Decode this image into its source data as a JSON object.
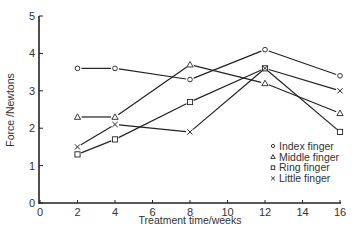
{
  "chart_data": {
    "type": "line",
    "title": "",
    "xlabel": "Treatment time/weeks",
    "ylabel": "Force /Newtons",
    "xlim": [
      0,
      16
    ],
    "ylim": [
      0,
      5
    ],
    "xticks": [
      0,
      2,
      4,
      6,
      8,
      10,
      12,
      14,
      16
    ],
    "yticks": [
      0,
      1,
      2,
      3,
      4,
      5
    ],
    "grid": false,
    "legend_position": "lower right",
    "x": [
      2,
      4,
      8,
      12,
      16
    ],
    "series": [
      {
        "name": "Index finger",
        "marker": "circle",
        "values": [
          3.6,
          3.6,
          3.3,
          4.1,
          3.4
        ]
      },
      {
        "name": "Middle finger",
        "marker": "triangle",
        "values": [
          2.3,
          2.3,
          3.7,
          3.2,
          2.4
        ]
      },
      {
        "name": "Ring finger",
        "marker": "square",
        "values": [
          1.3,
          1.7,
          2.7,
          3.6,
          1.9
        ]
      },
      {
        "name": "Little finger",
        "marker": "cross",
        "values": [
          1.5,
          2.1,
          1.9,
          3.6,
          3.0
        ]
      }
    ]
  },
  "legend": {
    "items": [
      {
        "label": "Index finger"
      },
      {
        "label": "Middle finger"
      },
      {
        "label": "Ring finger"
      },
      {
        "label": "Little finger"
      }
    ]
  },
  "axes": {
    "x_title": "Treatment time/weeks",
    "y_title": "Force /Newtons"
  },
  "colors": {
    "ink": "#222222",
    "background": "#ffffff"
  }
}
